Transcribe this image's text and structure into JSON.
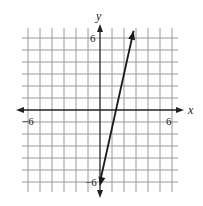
{
  "chart_data": {
    "type": "line",
    "title": "",
    "xlabel": "x",
    "ylabel": "y",
    "xlim": [
      -6.5,
      6.5
    ],
    "ylim": [
      -6.5,
      6.5
    ],
    "grid": true,
    "tick_labels": {
      "x": [
        "-6",
        "6"
      ],
      "y": [
        "6",
        "-6"
      ]
    },
    "series": [
      {
        "name": "line",
        "equation": "y = 4.5x - 6",
        "x": [
          0,
          2.8
        ],
        "y": [
          -6,
          6.6
        ],
        "arrows": "both"
      }
    ]
  },
  "labels": {
    "x_axis": "x",
    "y_axis": "y",
    "x_neg": "−6",
    "x_pos": "6",
    "y_pos": "6",
    "y_neg": "−6"
  },
  "colors": {
    "grid": "#9a9a9a",
    "axis": "#222222",
    "line": "#1a1a1a"
  }
}
